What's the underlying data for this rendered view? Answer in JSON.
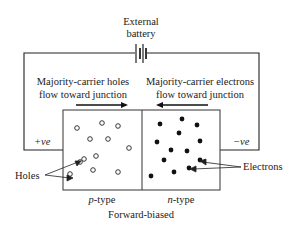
{
  "battery": {
    "line1": "External",
    "line2": "battery"
  },
  "left_flow": {
    "line1": "Majority-carrier holes",
    "line2": "flow toward junction"
  },
  "right_flow": {
    "line1": "Majority-carrier electrons",
    "line2": "flow toward junction"
  },
  "terminals": {
    "positive": "+ve",
    "negative": "−ve"
  },
  "regions": {
    "p_prefix": "p",
    "p_suffix": "-type",
    "n_prefix": "n",
    "n_suffix": "-type"
  },
  "callouts": {
    "holes": "Holes",
    "electrons": "Electrons"
  },
  "caption": "Forward-biased",
  "holes": [
    [
      77,
      128
    ],
    [
      102,
      123
    ],
    [
      118,
      126
    ],
    [
      90,
      139
    ],
    [
      108,
      139
    ],
    [
      129,
      148
    ],
    [
      96,
      156
    ],
    [
      84,
      159
    ],
    [
      70,
      174
    ],
    [
      93,
      170
    ],
    [
      118,
      172
    ],
    [
      80,
      162
    ]
  ],
  "electrons": [
    [
      160,
      124
    ],
    [
      182,
      119
    ],
    [
      197,
      125
    ],
    [
      179,
      133
    ],
    [
      157,
      142
    ],
    [
      200,
      141
    ],
    [
      171,
      150
    ],
    [
      187,
      151
    ],
    [
      164,
      160
    ],
    [
      200,
      160
    ],
    [
      151,
      176
    ],
    [
      174,
      172
    ],
    [
      189,
      168
    ]
  ]
}
